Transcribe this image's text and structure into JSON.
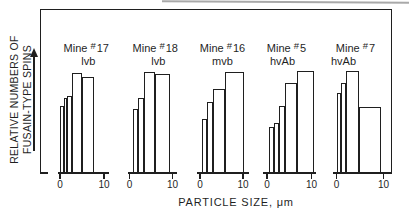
{
  "figure": {
    "y_axis_label_line1": "RELATIVE NUMBERS OF",
    "y_axis_label_line2": "FUSAIN-TYPE SPINS",
    "x_axis_title": "PARTICLE SIZE, μm",
    "ink_color": "#1f1f1f",
    "background_color": "#ffffff"
  },
  "chart_data": {
    "type": "bar",
    "subtype": "histogram-small-multiples",
    "title": "",
    "xlabel": "PARTICLE SIZE, μm",
    "ylabel": "RELATIVE NUMBERS OF FUSAIN-TYPE SPINS",
    "x_tick_labels": [
      "0",
      "10"
    ],
    "x_range_um": [
      0,
      10
    ],
    "y_axis_note": "unlabeled relative scale; upward arrow indicates increasing values",
    "grid": "off",
    "legend": "none",
    "panels": [
      {
        "id": "17",
        "line1_prefix": "Mine",
        "hash": "#",
        "number": "17",
        "rank": "lvb",
        "bars": [
          {
            "from_um": 0.0,
            "to_um": 0.8,
            "rel_h": 0.66
          },
          {
            "from_um": 0.8,
            "to_um": 1.7,
            "rel_h": 0.74
          },
          {
            "from_um": 1.7,
            "to_um": 2.65,
            "rel_h": 0.76
          },
          {
            "from_um": 2.65,
            "to_um": 4.9,
            "rel_h": 0.98
          },
          {
            "from_um": 4.9,
            "to_um": 7.8,
            "rel_h": 0.94
          }
        ],
        "layout": {
          "axis_left": 58,
          "axis_width": 50.5,
          "x0": 60,
          "x10": 104,
          "label_dx": 3,
          "rank_dx": 2
        }
      },
      {
        "id": "18",
        "line1_prefix": "Mine",
        "hash": "#",
        "number": "18",
        "rank": "lvb",
        "bars": [
          {
            "from_um": 0.75,
            "to_um": 2.05,
            "rel_h": 0.63
          },
          {
            "from_um": 2.05,
            "to_um": 3.45,
            "rel_h": 0.74
          },
          {
            "from_um": 3.45,
            "to_um": 6.0,
            "rel_h": 0.99
          },
          {
            "from_um": 6.0,
            "to_um": 9.4,
            "rel_h": 0.97
          }
        ],
        "layout": {
          "axis_left": 127.5,
          "axis_width": 49.5,
          "x0": 129.5,
          "x10": 172.5,
          "label_dx": 3,
          "rank_dx": 3
        }
      },
      {
        "id": "16",
        "line1_prefix": "Mine",
        "hash": "#",
        "number": "16",
        "rank": "mvb",
        "bars": [
          {
            "from_um": 0.4,
            "to_um": 1.7,
            "rel_h": 0.53
          },
          {
            "from_um": 1.7,
            "to_um": 3.0,
            "rel_h": 0.7
          },
          {
            "from_um": 3.0,
            "to_um": 5.8,
            "rel_h": 0.83
          },
          {
            "from_um": 5.8,
            "to_um": 10.3,
            "rel_h": 0.99
          }
        ],
        "layout": {
          "axis_left": 196.5,
          "axis_width": 52,
          "x0": 200,
          "x10": 243,
          "label_dx": 0,
          "rank_dx": 0
        }
      },
      {
        "id": "5",
        "line1_prefix": "Mine",
        "hash": "#",
        "number": "5",
        "rank": "hvAb",
        "bars": [
          {
            "from_um": 0.4,
            "to_um": 1.5,
            "rel_h": 0.46
          },
          {
            "from_um": 1.5,
            "to_um": 2.6,
            "rel_h": 0.5
          },
          {
            "from_um": 2.6,
            "to_um": 4.0,
            "rel_h": 0.66
          },
          {
            "from_um": 4.0,
            "to_um": 6.75,
            "rel_h": 0.88
          },
          {
            "from_um": 6.75,
            "to_um": 10.6,
            "rel_h": 1.0
          }
        ],
        "layout": {
          "axis_left": 263,
          "axis_width": 53,
          "x0": 267,
          "x10": 311.5,
          "label_dx": -3,
          "rank_dx": -4
        }
      },
      {
        "id": "7",
        "line1_prefix": "Mine",
        "hash": "#",
        "number": "7",
        "rank": "hvAb",
        "bars": [
          {
            "from_um": 0.0,
            "to_um": 1.0,
            "rel_h": 0.79
          },
          {
            "from_um": 1.0,
            "to_um": 2.0,
            "rel_h": 0.88
          },
          {
            "from_um": 2.0,
            "to_um": 4.85,
            "rel_h": 1.0
          },
          {
            "from_um": 4.85,
            "to_um": 9.4,
            "rel_h": 0.65
          }
        ],
        "layout": {
          "axis_left": 332.5,
          "axis_width": 56,
          "x0": 336.5,
          "x10": 383.5,
          "label_dx": -5,
          "rank_dx": -12
        }
      }
    ],
    "layout": {
      "baseline_y": 174,
      "panel_top": 9,
      "unit_height_px": 103,
      "label_top": 42,
      "tick_label_top": 178.5
    }
  }
}
